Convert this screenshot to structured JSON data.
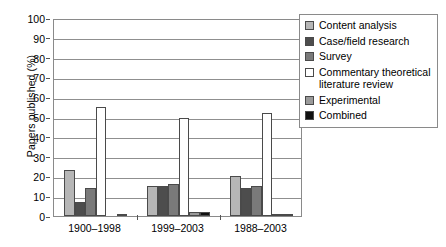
{
  "chart_data": {
    "type": "bar",
    "title": "",
    "xlabel": "",
    "ylabel": "Papers published (%)",
    "ylim": [
      0,
      100
    ],
    "ytick_step": 10,
    "grid": true,
    "legend_position": "right",
    "categories": [
      "1900–1998",
      "1999–2003",
      "1988–2003"
    ],
    "series": [
      {
        "name": "Content analysis",
        "color": "#b6b6b6",
        "values": [
          23,
          15,
          20
        ]
      },
      {
        "name": "Case/field research",
        "color": "#4d4d4d",
        "values": [
          7,
          15,
          14
        ]
      },
      {
        "name": "Survey",
        "color": "#7a7a7a",
        "values": [
          14,
          16,
          15
        ]
      },
      {
        "name": "Commentary theoretical\nliterature review",
        "color": "#ffffff",
        "values": [
          55,
          49.5,
          52
        ]
      },
      {
        "name": "Experimental",
        "color": "#9a9a9a",
        "values": [
          0,
          2,
          1
        ]
      },
      {
        "name": "Combined",
        "color": "#111111",
        "values": [
          1,
          2,
          1
        ]
      }
    ],
    "ytick_labels": [
      "0",
      "10",
      "20",
      "30",
      "40",
      "50",
      "60",
      "70",
      "80",
      "90",
      "100"
    ],
    "axis_color": "#8a8a8a",
    "gridline_color": "#8f8f8f"
  },
  "legend": {
    "items": [
      {
        "label": "Content analysis",
        "swatch": "#b6b6b6"
      },
      {
        "label": "Case/field research",
        "swatch": "#4d4d4d"
      },
      {
        "label": "Survey",
        "swatch": "#7a7a7a"
      },
      {
        "label": "Commentary theoretical\nliterature review",
        "swatch": "#ffffff"
      },
      {
        "label": "Experimental",
        "swatch": "#9a9a9a"
      },
      {
        "label": "Combined",
        "swatch": "#111111"
      }
    ]
  }
}
